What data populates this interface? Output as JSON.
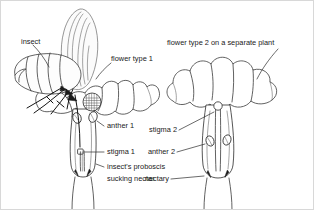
{
  "figure": {
    "background_color": "#ffffff",
    "ink_color": "#3a3a3a",
    "text_color": "#1a1a1a"
  },
  "labels": {
    "insect": "insect",
    "flower_type_1": "flower type 1",
    "flower_type_2": "flower type 2 on a separate plant",
    "anther_1": "anther 1",
    "stigma_1": "stigma 1",
    "proboscis_line_1": "insect's proboscis",
    "proboscis_line_2": "sucking nectar",
    "stigma_2": "stigma 2",
    "anther_2": "anther 2",
    "nectary": "nectary"
  },
  "parts": {
    "left_plant": [
      "insect",
      "flower type 1",
      "anther 1",
      "stigma 1",
      "insect's proboscis sucking nectar"
    ],
    "right_plant": [
      "flower type 2 on a separate plant",
      "stigma 2",
      "anther 2",
      "nectary"
    ]
  }
}
